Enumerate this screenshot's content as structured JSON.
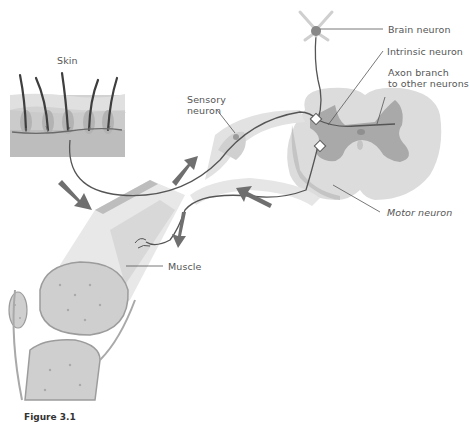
{
  "figure": {
    "caption": "Figure 3.1"
  },
  "labels": {
    "skin": "Skin",
    "sensory_neuron_line1": "Sensory",
    "sensory_neuron_line2": "neuron",
    "brain_neuron": "Brain neuron",
    "intrinsic_neuron": "Intrinsic neuron",
    "axon_branch_line1": "Axon branch",
    "axon_branch_line2": "to other neurons",
    "motor_neuron": "Motor neuron",
    "muscle": "Muscle"
  },
  "colors": {
    "background": "#ffffff",
    "tissue_light": "#e6e6e6",
    "tissue_mid": "#cfcfcf",
    "grey_matter": "#a9a9a9",
    "skin_layer": "#c8c8c8",
    "nerve_line": "#555555",
    "arrow": "#6f6f6f",
    "label_text": "#555555"
  }
}
